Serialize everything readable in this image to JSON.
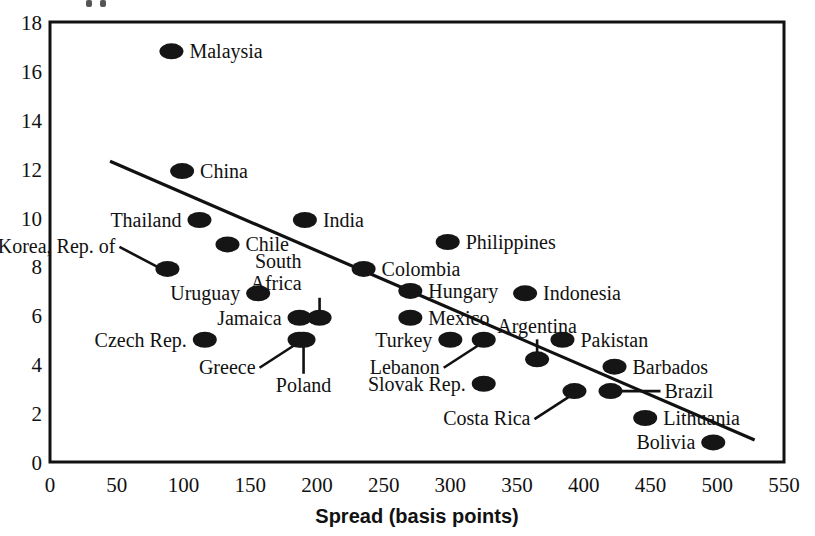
{
  "chart_data": {
    "type": "scatter",
    "title": "",
    "xlabel": "Spread (basis points)",
    "ylabel": "",
    "xlim": [
      0,
      550
    ],
    "ylim": [
      0,
      18
    ],
    "xticks": [
      "0",
      "50",
      "100",
      "150",
      "200",
      "250",
      "300",
      "350",
      "400",
      "450",
      "500",
      "550"
    ],
    "yticks": [
      "0",
      "2",
      "4",
      "6",
      "8",
      "10",
      "12",
      "14",
      "16",
      "18"
    ],
    "grid": false,
    "legend": "none",
    "points": [
      {
        "label": "Malaysia",
        "x": 91,
        "y": 16.8,
        "label_pos": "right"
      },
      {
        "label": "China",
        "x": 99,
        "y": 11.9,
        "label_pos": "right"
      },
      {
        "label": "Thailand",
        "x": 112,
        "y": 9.9,
        "label_pos": "left"
      },
      {
        "label": "India",
        "x": 191,
        "y": 9.9,
        "label_pos": "right"
      },
      {
        "label": "Philippines",
        "x": 298,
        "y": 9.0,
        "label_pos": "right"
      },
      {
        "label": "Chile",
        "x": 133,
        "y": 8.9,
        "label_pos": "right"
      },
      {
        "label": "Korea, Rep. of",
        "x": 88,
        "y": 7.9,
        "label_pos": "leader-upleft"
      },
      {
        "label": "Colombia",
        "x": 235,
        "y": 7.9,
        "label_pos": "right"
      },
      {
        "label": "South Africa",
        "x": 202,
        "y": 5.9,
        "label_pos": "leader-up"
      },
      {
        "label": "Uruguay",
        "x": 156,
        "y": 6.9,
        "label_pos": "left"
      },
      {
        "label": "Hungary",
        "x": 270,
        "y": 7.0,
        "label_pos": "right"
      },
      {
        "label": "Indonesia",
        "x": 356,
        "y": 6.9,
        "label_pos": "right"
      },
      {
        "label": "Jamaica",
        "x": 187,
        "y": 5.9,
        "label_pos": "left"
      },
      {
        "label": "Mexico",
        "x": 270,
        "y": 5.9,
        "label_pos": "right"
      },
      {
        "label": "Czech Rep.",
        "x": 116,
        "y": 5.0,
        "label_pos": "left"
      },
      {
        "label": "Greece",
        "x": 187,
        "y": 5.0,
        "label_pos": "leader-downleft"
      },
      {
        "label": "Poland",
        "x": 190,
        "y": 5.0,
        "label_pos": "leader-down"
      },
      {
        "label": "Turkey",
        "x": 300,
        "y": 5.0,
        "label_pos": "left"
      },
      {
        "label": "Lebanon",
        "x": 325,
        "y": 5.0,
        "label_pos": "leader-downleft"
      },
      {
        "label": "Pakistan",
        "x": 384,
        "y": 5.0,
        "label_pos": "right"
      },
      {
        "label": "Argentina",
        "x": 365,
        "y": 4.2,
        "label_pos": "leader-up"
      },
      {
        "label": "Barbados",
        "x": 423,
        "y": 3.9,
        "label_pos": "right"
      },
      {
        "label": "Slovak Rep.",
        "x": 325,
        "y": 3.2,
        "label_pos": "left"
      },
      {
        "label": "Costa Rica",
        "x": 393,
        "y": 2.9,
        "label_pos": "leader-downleft"
      },
      {
        "label": "Brazil",
        "x": 420,
        "y": 2.9,
        "label_pos": "leader-right"
      },
      {
        "label": "Lithuania",
        "x": 446,
        "y": 1.8,
        "label_pos": "right"
      },
      {
        "label": "Bolivia",
        "x": 497,
        "y": 0.8,
        "label_pos": "left"
      }
    ],
    "trend_line": {
      "x0": 45,
      "y0": 12.3,
      "x1": 528,
      "y1": 0.9
    },
    "marker_style": {
      "shape": "ellipse",
      "color": "#151515",
      "rx": 12,
      "ry": 8
    }
  }
}
